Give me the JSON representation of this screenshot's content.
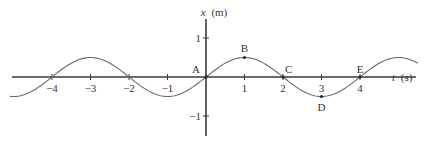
{
  "chart_data": {
    "type": "line",
    "title": "",
    "xlabel_var": "t",
    "xlabel_unit": "(s)",
    "ylabel_var": "x",
    "ylabel_unit": "(m)",
    "xlim": [
      -5.1,
      5.5
    ],
    "ylim": [
      -1.5,
      1.5
    ],
    "x_ticks": [
      -4,
      -3,
      -2,
      -1,
      1,
      2,
      3,
      4
    ],
    "x_tick_labels": [
      "−4",
      "−3",
      "−2",
      "−1",
      "1",
      "2",
      "3",
      "4"
    ],
    "y_ticks": [
      1,
      -1
    ],
    "y_tick_labels": [
      "1",
      "−1"
    ],
    "series": [
      {
        "name": "x(t)",
        "function": "0.5*sin(pi*t/2)",
        "amplitude": 0.5,
        "period": 4,
        "t_range": [
          -5.1,
          5.5
        ]
      }
    ],
    "points": [
      {
        "label": "A",
        "t": 0,
        "x": 0
      },
      {
        "label": "B",
        "t": 1,
        "x": 0.5
      },
      {
        "label": "C",
        "t": 2,
        "x": 0
      },
      {
        "label": "D",
        "t": 3,
        "x": -0.5
      },
      {
        "label": "E",
        "t": 4,
        "x": 0
      }
    ],
    "grid": false,
    "legend": "none"
  }
}
